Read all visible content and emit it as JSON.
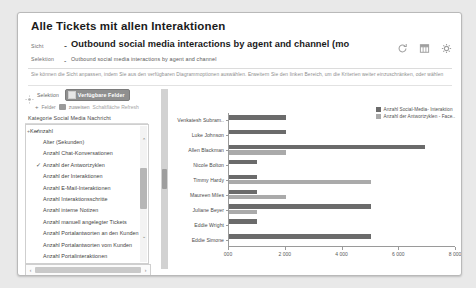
{
  "window": {
    "title": "Alle Tickets mit allen Interaktionen"
  },
  "header": {
    "sicht_label": "Sicht",
    "sicht_separator": "-",
    "sicht_value": "Outbound social media interactions by agent and channel (mo",
    "selection_label": "Selektion",
    "selection_separator": "-",
    "selection_value": "Outbound social media interactions by agent and channel",
    "icons": [
      {
        "name": "refresh-icon",
        "label": "Aktualisieren"
      },
      {
        "name": "table-icon",
        "label": "Tabelle"
      },
      {
        "name": "gear-icon",
        "label": "Einstellungen"
      }
    ]
  },
  "hint": {
    "text": "Sie können die Sicht anpassen, indem Sie aus den verfügbaren Diagrammoptionen auswählen. Erweitern Sie den linken Bereich, um die Kriterien weiter einzuschränken, oder wählen"
  },
  "sidebar": {
    "selection_label": "Selektion",
    "available_fields_button": "Verfügbare Felder",
    "subrow": {
      "plus": "+",
      "text_a": "Felder",
      "text_b": "zuweisen",
      "text_c": "Schaltfläche Refresh"
    },
    "category_label": "Kategorie Social Media Nachricht",
    "tree": [
      {
        "label": "Kennzahl",
        "level": 0,
        "checked": true,
        "twisty": "+"
      },
      {
        "label": "Alter (Sekunden)",
        "level": 1,
        "checked": false,
        "twisty": ""
      },
      {
        "label": "Anzahl Chat-Konversationen",
        "level": 1,
        "checked": false,
        "twisty": ""
      },
      {
        "label": "Anzahl der Antwortzyklen",
        "level": 1,
        "checked": true,
        "twisty": ""
      },
      {
        "label": "Anzahl der Interaktionen",
        "level": 1,
        "checked": false,
        "twisty": ""
      },
      {
        "label": "Anzahl E-Mail-Interaktionen",
        "level": 1,
        "checked": false,
        "twisty": ""
      },
      {
        "label": "Anzahl Interaktionsschritte",
        "level": 1,
        "checked": false,
        "twisty": ""
      },
      {
        "label": "Anzahl interne Notizen",
        "level": 1,
        "checked": false,
        "twisty": ""
      },
      {
        "label": "Anzahl manuell angelegter Tickets",
        "level": 1,
        "checked": false,
        "twisty": ""
      },
      {
        "label": "Anzahl Portalantworten an den Kunden",
        "level": 1,
        "checked": false,
        "twisty": ""
      },
      {
        "label": "Anzahl Portalantworten vom Kunden",
        "level": 1,
        "checked": false,
        "twisty": ""
      },
      {
        "label": "Anzahl Portalinteraktionen",
        "level": 1,
        "checked": false,
        "twisty": ""
      },
      {
        "label": "Anzahl Social-Media- Interaktionen",
        "level": 1,
        "checked": true,
        "twisty": ""
      }
    ],
    "scroll_up": "⌃",
    "scroll_down": "⌄",
    "hscroll_left": "‹",
    "hscroll_right": "›"
  },
  "chart_data": {
    "type": "bar",
    "orientation": "horizontal",
    "title": "",
    "xlabel": "",
    "ylabel": "",
    "xlim": [
      0,
      8000
    ],
    "xticks": [
      0,
      2000,
      4000,
      6000,
      8000
    ],
    "xticklabels": [
      "000",
      "2 000",
      "4 000",
      "6 000",
      "8 000"
    ],
    "grid": false,
    "legend_position": "top-right",
    "categories": [
      "Venkatesh Subram..",
      "Luke Johnson",
      "Allen Blackman",
      "Nicole Bolton",
      "Timmy Hardy",
      "Maureen Miles",
      "Juliane Beyer",
      "Eddie Wright",
      "Eddie Simone"
    ],
    "series": [
      {
        "name": "Anzahl Social-Media- Interaktion",
        "color": "#6b6b6b",
        "values": [
          2000,
          2000,
          6900,
          1000,
          1000,
          1000,
          5000,
          1000,
          5000
        ]
      },
      {
        "name": "Anzahl der Antwortzyklen - Face..",
        "color": "#aaaaaa",
        "values": [
          0,
          0,
          2000,
          0,
          5000,
          2000,
          1000,
          0,
          0
        ]
      }
    ]
  }
}
